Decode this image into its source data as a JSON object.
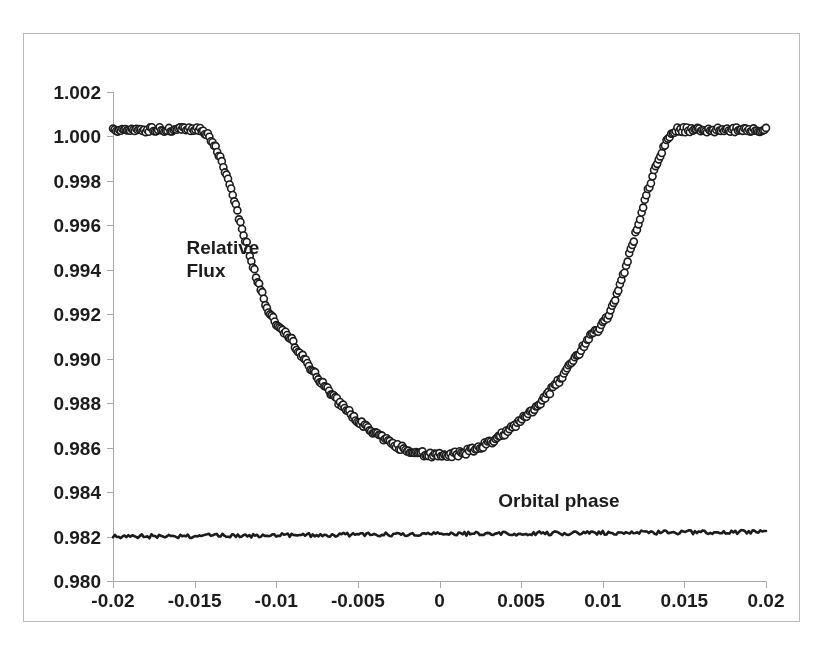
{
  "figure": {
    "background_color": "#ffffff",
    "frame_color": "#b9b9b9",
    "ink_color": "#1c1c1c",
    "axis_color": "#a8a8a8"
  },
  "labels": {
    "relative_flux": "Relative\nFlux",
    "orbital_phase": "Orbital phase"
  },
  "chart_data": {
    "type": "scatter",
    "title": "",
    "xlabel": "Orbital phase",
    "ylabel": "Relative Flux",
    "xlim": [
      -0.02,
      0.02
    ],
    "ylim": [
      0.98,
      1.002
    ],
    "grid": false,
    "legend": null,
    "xticks": [
      -0.02,
      -0.015,
      -0.01,
      -0.005,
      0,
      0.005,
      0.01,
      0.015,
      0.02
    ],
    "xtick_labels": [
      "-0.02",
      "-0.015",
      "-0.01",
      "-0.005",
      "0",
      "0.005",
      "0.01",
      "0.015",
      "0.02"
    ],
    "yticks": [
      0.98,
      0.982,
      0.984,
      0.986,
      0.988,
      0.99,
      0.992,
      0.994,
      0.996,
      0.998,
      1.0,
      1.002
    ],
    "ytick_labels": [
      "0.980",
      "0.982",
      "0.984",
      "0.986",
      "0.988",
      "0.990",
      "0.992",
      "0.994",
      "0.996",
      "0.998",
      "1.000",
      "1.002"
    ],
    "annotations": [
      {
        "text": "Relative\nFlux",
        "x": -0.0155,
        "y": 0.9955
      },
      {
        "text": "Orbital phase",
        "x": 0.0085,
        "y": 0.9828
      }
    ],
    "series": [
      {
        "name": "transit-light-curve",
        "marker": "open-circle",
        "marker_size_px": 7,
        "color": "#1c1c1c",
        "description": "Phase-folded planetary transit light curve, flat out-of-transit baseline at 1.0003, ingress from phase -0.0147 to -0.0094, flat-bottomed minimum near 0.98565 at phase 0, egress from phase 0.0094 to 0.0147.",
        "model": {
          "baseline": 1.0003,
          "depth": 0.01465,
          "t_first_contact": -0.0147,
          "t_second_contact": -0.0094,
          "t_third_contact": 0.0094,
          "t_fourth_contact": 0.0147,
          "limb_darkening": 0.38,
          "scatter_amplitude": 0.00012,
          "n_points": 420
        }
      },
      {
        "name": "residual-baseline",
        "marker": "none",
        "line": "solid",
        "color": "#1c1c1c",
        "description": "Flat noisy residual trace offset near 0.9820, drifting up very slightly to 0.98222 at phase +0.02.",
        "model": {
          "y_start": 0.982,
          "y_end": 0.98222,
          "noise_amplitude": 9e-05,
          "n_points": 340
        }
      }
    ]
  },
  "plot_geometry": {
    "left_px": 113,
    "right_px": 766,
    "top_px": 92,
    "bottom_px": 581
  }
}
